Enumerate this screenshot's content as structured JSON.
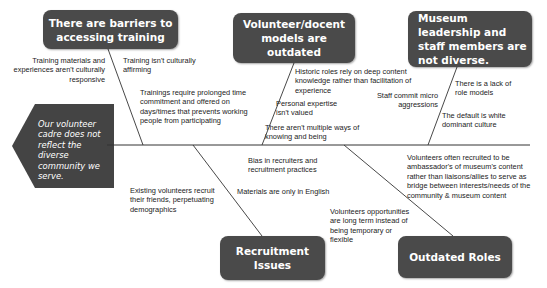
{
  "diagram": {
    "type": "fishbone",
    "colors": {
      "box_fill": "#4a4a4a",
      "head_fill": "#444444",
      "line": "#333333",
      "text": "#222222",
      "box_text": "#ffffff"
    },
    "problem": "Our volunteer cadre does not reflect the diverse community we serve.",
    "categories": {
      "training": {
        "label": "There are barriers to accessing training",
        "causes": [
          "Training materials and experiences aren't culturally responsive",
          "Training isn't culturally affirming",
          "Trainings require prolonged time commitment and offered on days/times that prevents working people from participating"
        ]
      },
      "models": {
        "label": "Volunteer/docent models are outdated",
        "causes": [
          "Historic roles rely on deep content knowledge rather than facilitation of experience",
          "Personal expertise isn't valued",
          "There aren't multiple ways of knowing and being"
        ]
      },
      "leadership": {
        "label": "Museum leadership and staff members are not diverse.",
        "causes": [
          "There is a lack of role models",
          "Staff commit micro aggressions",
          "The default is white dominant culture"
        ]
      },
      "recruitment": {
        "label": "Recruitment Issues",
        "causes": [
          "Bias in recruiters and recruitment practices",
          "Materials are only in English",
          "Existing volunteers recruit their friends, perpetuating demographics"
        ]
      },
      "roles": {
        "label": "Outdated Roles",
        "causes": [
          "Volunteers often recruited to be ambassador's of museum's content rather than liaisons/allies to serve as bridge between interests/needs of the community & museum content",
          "Volunteers opportunities are long term instead of being temporary or flexible"
        ]
      }
    }
  }
}
